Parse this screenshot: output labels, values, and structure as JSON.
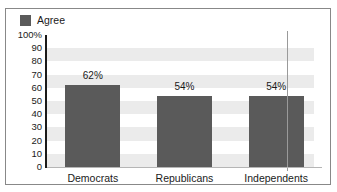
{
  "legend": {
    "items": [
      {
        "label": "Agree",
        "color": "#5a5a5a",
        "swatch_icon": "legend-swatch-icon"
      }
    ],
    "position": "top-left"
  },
  "axes": {
    "y_ticks": [
      "100%",
      "90",
      "80",
      "70",
      "60",
      "50",
      "40",
      "30",
      "20",
      "10",
      "0"
    ],
    "x_ticks": [
      "Democrats",
      "Republicans",
      "Independents"
    ]
  },
  "bars": [
    {
      "category": "Democrats",
      "value": 62,
      "label": "62%"
    },
    {
      "category": "Republicans",
      "value": 54,
      "label": "54%"
    },
    {
      "category": "Independents",
      "value": 54,
      "label": "54%"
    }
  ],
  "colors": {
    "bar": "#5a5a5a",
    "band": "#ebebeb",
    "plot_background": "#ffffff",
    "frame_border": "#888888",
    "axis_line": "#1a1a1a",
    "text": "#1a1a1a"
  },
  "chart_data": {
    "type": "bar",
    "title": "",
    "subtitle": "",
    "xlabel": "",
    "ylabel": "",
    "categories": [
      "Democrats",
      "Republicans",
      "Independents"
    ],
    "values": [
      62,
      54,
      54
    ],
    "data_labels": [
      "62%",
      "54%",
      "54%"
    ],
    "series": [
      {
        "name": "Agree",
        "values": [
          62,
          54,
          54
        ],
        "color": "#5a5a5a"
      }
    ],
    "ylim": [
      0,
      100
    ],
    "y_tick_values": [
      0,
      10,
      20,
      30,
      40,
      50,
      60,
      70,
      80,
      90,
      100
    ],
    "y_tick_labels": [
      "0",
      "10",
      "20",
      "30",
      "40",
      "50",
      "60",
      "70",
      "80",
      "90",
      "100%"
    ],
    "units": "percent",
    "grid": "horizontal-bands",
    "legend_position": "top-left",
    "legend_entries": [
      "Agree"
    ]
  }
}
